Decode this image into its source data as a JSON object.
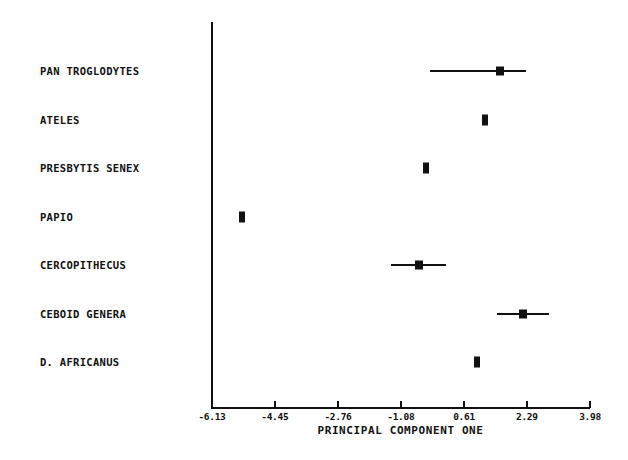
{
  "chart_data": {
    "type": "scatter",
    "title": "",
    "xlabel": "PRINCIPAL COMPONENT ONE",
    "ylabel": "",
    "xlim": [
      -6.13,
      3.98
    ],
    "grid": false,
    "legend": null,
    "xticks": [
      -6.13,
      -4.45,
      -2.76,
      -1.08,
      0.61,
      2.29,
      3.98
    ],
    "xticklabels": [
      "-6.13",
      "-4.45",
      "-2.76",
      "-1.08",
      "0.61",
      "2.29",
      "3.98"
    ],
    "categories": [
      "PAN TROGLODYTES",
      "ATELES",
      "PRESBYTIS SENEX",
      "PAPIO",
      "CERCOPITHECUS",
      "CEBOID GENERA",
      "D. AFRICANUS"
    ],
    "values": [
      1.57,
      1.17,
      -0.41,
      -5.33,
      -0.6,
      2.19,
      0.96
    ],
    "errors": [
      0.7,
      0.0,
      0.0,
      0.0,
      0.74,
      0.7,
      0.0
    ],
    "points": [
      {
        "label": "PAN TROGLODYTES",
        "value": 1.57,
        "error": 0.7,
        "low": -0.3,
        "high": 2.27,
        "has_errorbar": true
      },
      {
        "label": "ATELES",
        "value": 1.17,
        "error": 0.0,
        "low": 1.17,
        "high": 1.17,
        "has_errorbar": false
      },
      {
        "label": "PRESBYTIS SENEX",
        "value": -0.41,
        "error": 0.0,
        "low": -0.41,
        "high": -0.41,
        "has_errorbar": false
      },
      {
        "label": "PAPIO",
        "value": -5.33,
        "error": 0.0,
        "low": -5.33,
        "high": -5.33,
        "has_errorbar": false
      },
      {
        "label": "CERCOPITHECUS",
        "value": -0.6,
        "error": 0.74,
        "low": -1.34,
        "high": 0.14,
        "has_errorbar": true
      },
      {
        "label": "CEBOID GENERA",
        "value": 2.19,
        "error": 0.7,
        "low": 1.49,
        "high": 2.89,
        "has_errorbar": true
      },
      {
        "label": "D. AFRICANUS",
        "value": 0.96,
        "error": 0.0,
        "low": 0.96,
        "high": 0.96,
        "has_errorbar": false
      }
    ]
  },
  "style": {
    "ink_color": "#111111",
    "background_color": "#ffffff"
  }
}
